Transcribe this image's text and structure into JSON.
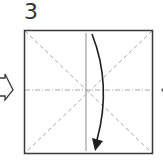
{
  "step": {
    "number": "3"
  },
  "diagram": {
    "square": {
      "x": 24,
      "y": 30,
      "size": 129,
      "stroke": "#3a3a3a"
    },
    "creases": {
      "diagonal_valley": {
        "color": "#a8a8a8",
        "dash": "4 3"
      },
      "horizontal_mountain": {
        "color": "#a8a8a8",
        "dash": "5 2 1 2"
      },
      "vertical_line": {
        "color": "#9a9a9a"
      }
    },
    "arrow": {
      "color": "#1e1e1e",
      "direction": "down",
      "meaning": "fold-top-down"
    },
    "left_arrow": {
      "meaning": "next-step-arrow"
    },
    "right_marker": {
      "meaning": "next-step-arrow"
    }
  }
}
